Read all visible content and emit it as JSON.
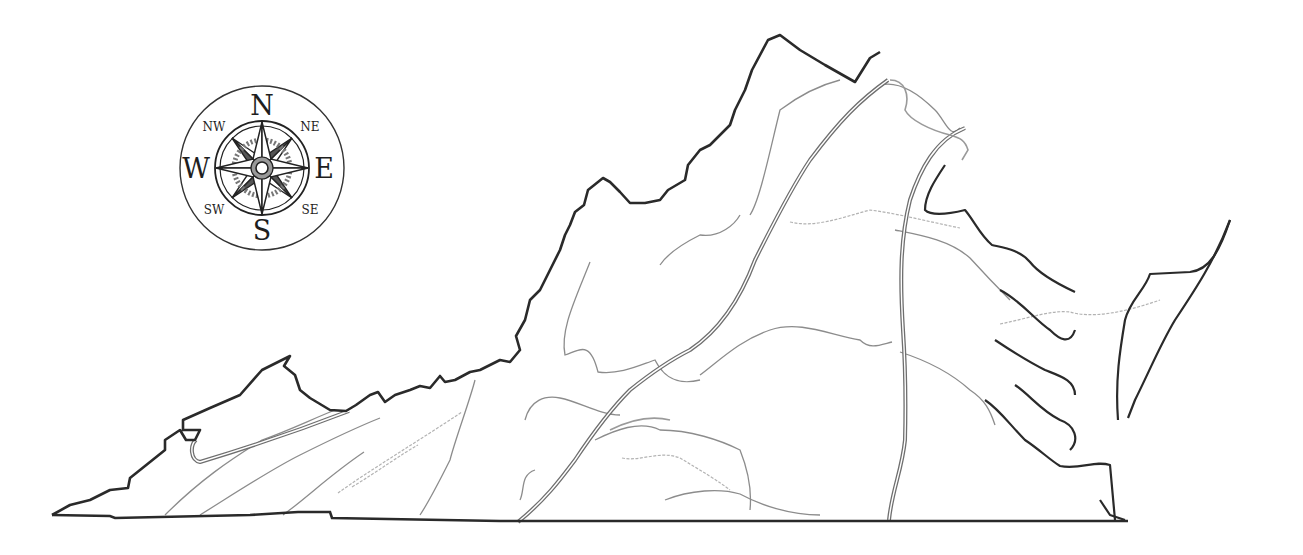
{
  "map": {
    "subject": "Virginia physiographic regions outline map",
    "colors": {
      "background": "#ffffff",
      "state_border": "#2a2a2a",
      "region_boundary": "#6e6e6e",
      "river": "#8a8a8a",
      "minor_river": "#b0b0b0",
      "coastline": "#2a2a2a"
    }
  },
  "compass": {
    "cardinal": {
      "north": "N",
      "south": "S",
      "east": "E",
      "west": "W"
    },
    "intercardinal": {
      "northwest": "NW",
      "northeast": "NE",
      "southwest": "SW",
      "southeast": "SE"
    }
  }
}
